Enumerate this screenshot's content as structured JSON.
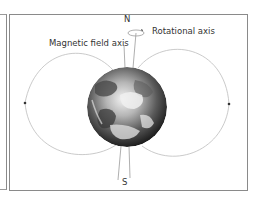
{
  "diagram": {
    "labels": {
      "north": "N",
      "south": "S",
      "rotational_axis": "Rotational axis",
      "magnetic_field_axis": "Magnetic field axis"
    },
    "colors": {
      "frame": "#8a8a8a",
      "field_lines": "#bdbdbd",
      "axis_lines": "#9a9a9a",
      "text": "#333333",
      "earth_dark": "#2a2a2a",
      "earth_light": "#e8e8e8"
    }
  }
}
